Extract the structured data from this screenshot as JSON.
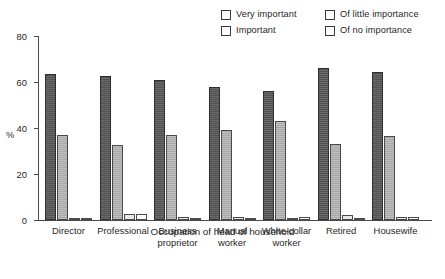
{
  "chart_data": {
    "type": "bar",
    "title": "",
    "subtitle": "",
    "xlabel": "Occupation of head of household",
    "ylabel": "%",
    "ylim": [
      0,
      80
    ],
    "yticks": [
      0,
      20,
      40,
      60,
      80
    ],
    "grid": false,
    "legend_position": "top-right",
    "categories": [
      "Director",
      "Professional",
      "Business\nproprietor",
      "Manual\nworker",
      "White-collar\nworker",
      "Retired",
      "Housewife"
    ],
    "series": [
      {
        "name": "Very important",
        "color": "#5a5a5a",
        "values": [
          63.5,
          62.5,
          61.0,
          58.0,
          56.0,
          66.0,
          64.5
        ]
      },
      {
        "name": "Important",
        "color": "#b4b4b4",
        "values": [
          37.0,
          32.5,
          37.0,
          39.0,
          43.0,
          33.0,
          36.5
        ]
      },
      {
        "name": "Of little importance",
        "color": "#e9e9e9",
        "values": [
          0.5,
          2.5,
          1.5,
          1.5,
          1.0,
          2.0,
          1.5
        ]
      },
      {
        "name": "Of no importance",
        "color": "#ffffff",
        "values": [
          0.4,
          2.5,
          0.5,
          1.0,
          1.5,
          1.0,
          1.5
        ]
      }
    ]
  },
  "legend": {
    "items": [
      {
        "label": "Very important"
      },
      {
        "label": "Important"
      },
      {
        "label": "Of little importance"
      },
      {
        "label": "Of no importance"
      }
    ]
  }
}
